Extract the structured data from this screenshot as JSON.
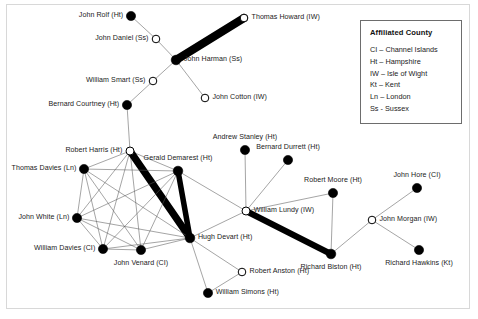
{
  "figure": {
    "background_color": "#ffffff",
    "frame_color": "#d8d8d8",
    "node_fill_color": "#000000",
    "node_hollow_color": "#ffffff",
    "edge_color": "#5a5a5a",
    "thick_edge_color": "#000000"
  },
  "legend": {
    "title": "Affiliated County",
    "entries": [
      "CI – Channel Islands",
      "Ht – Hampshire",
      "IW – Isle of Wight",
      "Kt – Kent",
      "Ln – London",
      "Ss - Sussex"
    ]
  },
  "chart_data": {
    "type": "network",
    "title": "",
    "xlabel": "",
    "ylabel": "",
    "legend_position": "top-right",
    "grid": false,
    "node_shape_meaning": {
      "filled": "solid black circle",
      "hollow": "open white circle with black outline"
    },
    "nodes": [
      {
        "id": "john_rolf",
        "label": "John Rolf (Ht)",
        "county": "Ht",
        "x": 131,
        "y": 16,
        "fill": "filled",
        "label_side": "right",
        "size": 5.2
      },
      {
        "id": "thomas_howard",
        "label": "Thomas Howard (IW)",
        "county": "IW",
        "x": 244,
        "y": 18,
        "fill": "hollow",
        "label_side": "left",
        "size": 5.0
      },
      {
        "id": "john_daniel",
        "label": "John Daniel (Ss)",
        "county": "Ss",
        "x": 156,
        "y": 39,
        "fill": "hollow",
        "label_side": "right",
        "size": 5.0
      },
      {
        "id": "john_harman",
        "label": "John Harman (Ss)",
        "county": "Ss",
        "x": 176,
        "y": 60,
        "fill": "filled",
        "label_side": "left",
        "size": 5.4
      },
      {
        "id": "william_smart",
        "label": "William Smart (Ss)",
        "county": "Ss",
        "x": 153,
        "y": 81,
        "fill": "hollow",
        "label_side": "right",
        "size": 5.0
      },
      {
        "id": "john_cotton",
        "label": "John Cotton (IW)",
        "county": "IW",
        "x": 205,
        "y": 98,
        "fill": "hollow",
        "label_side": "left",
        "size": 5.0
      },
      {
        "id": "bernard_courtney",
        "label": "Bernard Courtney (Ht)",
        "county": "Ht",
        "x": 127,
        "y": 105,
        "fill": "filled",
        "label_side": "right",
        "size": 5.2
      },
      {
        "id": "robert_harris",
        "label": "Robert Harris (Ht)",
        "county": "Ht",
        "x": 130,
        "y": 151,
        "fill": "hollow",
        "label_side": "right",
        "size": 5.2
      },
      {
        "id": "andrew_stanley",
        "label": "Andrew Stanley (Ht)",
        "county": "Ht",
        "x": 245,
        "y": 150,
        "fill": "filled",
        "label_side": "above",
        "size": 5.2
      },
      {
        "id": "bernard_durrett",
        "label": "Bernard Durrett (Ht)",
        "county": "Ht",
        "x": 288,
        "y": 160,
        "fill": "filled",
        "label_side": "above",
        "size": 5.2
      },
      {
        "id": "gerald_demarest",
        "label": "Gerald Demarest (Ht)",
        "county": "Ht",
        "x": 178,
        "y": 171,
        "fill": "filled",
        "label_side": "above",
        "size": 5.4
      },
      {
        "id": "thomas_davies",
        "label": "Thomas Davies (Ln)",
        "county": "Ln",
        "x": 84,
        "y": 169,
        "fill": "filled",
        "label_side": "right",
        "size": 5.2
      },
      {
        "id": "robert_moore",
        "label": "Robert Moore (Ht)",
        "county": "Ht",
        "x": 333,
        "y": 193,
        "fill": "filled",
        "label_side": "above",
        "size": 5.2
      },
      {
        "id": "john_hore",
        "label": "John Hore (CI)",
        "county": "CI",
        "x": 417,
        "y": 188,
        "fill": "filled",
        "label_side": "above",
        "size": 5.2
      },
      {
        "id": "william_lundy",
        "label": "William Lundy (IW)",
        "county": "IW",
        "x": 246,
        "y": 211,
        "fill": "hollow",
        "label_side": "left",
        "size": 5.2
      },
      {
        "id": "john_white",
        "label": "John White (Ln)",
        "county": "Ln",
        "x": 77,
        "y": 218,
        "fill": "filled",
        "label_side": "right",
        "size": 5.2
      },
      {
        "id": "john_morgan",
        "label": "John Morgan (IW)",
        "county": "IW",
        "x": 372,
        "y": 220,
        "fill": "hollow",
        "label_side": "left",
        "size": 5.0
      },
      {
        "id": "hugh_devart",
        "label": "Hugh Devart (Ht)",
        "county": "Ht",
        "x": 190,
        "y": 238,
        "fill": "filled",
        "label_side": "left",
        "size": 5.4
      },
      {
        "id": "william_davies",
        "label": "William Davies (CI)",
        "county": "CI",
        "x": 103,
        "y": 249,
        "fill": "filled",
        "label_side": "right",
        "size": 5.2
      },
      {
        "id": "john_venard",
        "label": "John Venard (CI)",
        "county": "CI",
        "x": 141,
        "y": 250,
        "fill": "filled",
        "label_side": "below",
        "size": 5.2
      },
      {
        "id": "richard_hawkins",
        "label": "Richard Hawkins (Kt)",
        "county": "Kt",
        "x": 419,
        "y": 250,
        "fill": "filled",
        "label_side": "below",
        "size": 5.2
      },
      {
        "id": "richard_biston",
        "label": "Richard Biston (Ht)",
        "county": "Ht",
        "x": 331,
        "y": 254,
        "fill": "filled",
        "label_side": "below",
        "size": 5.4
      },
      {
        "id": "robert_anston",
        "label": "Robert Anston (Ht)",
        "county": "Ht",
        "x": 242,
        "y": 272,
        "fill": "hollow",
        "label_side": "left",
        "size": 5.0
      },
      {
        "id": "william_simons",
        "label": "William Simons (Ht)",
        "county": "Ht",
        "x": 208,
        "y": 293,
        "fill": "filled",
        "label_side": "left",
        "size": 5.2
      }
    ],
    "edges": [
      {
        "source": "john_rolf",
        "target": "john_daniel",
        "weight": 1
      },
      {
        "source": "john_daniel",
        "target": "john_harman",
        "weight": 1
      },
      {
        "source": "john_harman",
        "target": "thomas_howard",
        "weight": 9
      },
      {
        "source": "john_harman",
        "target": "john_cotton",
        "weight": 1
      },
      {
        "source": "john_harman",
        "target": "william_smart",
        "weight": 1
      },
      {
        "source": "william_smart",
        "target": "bernard_courtney",
        "weight": 1
      },
      {
        "source": "bernard_courtney",
        "target": "robert_harris",
        "weight": 1
      },
      {
        "source": "robert_harris",
        "target": "thomas_davies",
        "weight": 1
      },
      {
        "source": "robert_harris",
        "target": "john_white",
        "weight": 1
      },
      {
        "source": "robert_harris",
        "target": "william_davies",
        "weight": 1
      },
      {
        "source": "robert_harris",
        "target": "john_venard",
        "weight": 1
      },
      {
        "source": "robert_harris",
        "target": "gerald_demarest",
        "weight": 1
      },
      {
        "source": "robert_harris",
        "target": "hugh_devart",
        "weight": 8
      },
      {
        "source": "thomas_davies",
        "target": "john_white",
        "weight": 1
      },
      {
        "source": "thomas_davies",
        "target": "william_davies",
        "weight": 1
      },
      {
        "source": "thomas_davies",
        "target": "john_venard",
        "weight": 1
      },
      {
        "source": "thomas_davies",
        "target": "gerald_demarest",
        "weight": 1
      },
      {
        "source": "thomas_davies",
        "target": "hugh_devart",
        "weight": 1
      },
      {
        "source": "john_white",
        "target": "william_davies",
        "weight": 1
      },
      {
        "source": "john_white",
        "target": "john_venard",
        "weight": 1
      },
      {
        "source": "john_white",
        "target": "gerald_demarest",
        "weight": 1
      },
      {
        "source": "john_white",
        "target": "hugh_devart",
        "weight": 1
      },
      {
        "source": "william_davies",
        "target": "john_venard",
        "weight": 1
      },
      {
        "source": "william_davies",
        "target": "gerald_demarest",
        "weight": 1
      },
      {
        "source": "william_davies",
        "target": "hugh_devart",
        "weight": 1
      },
      {
        "source": "john_venard",
        "target": "gerald_demarest",
        "weight": 1
      },
      {
        "source": "john_venard",
        "target": "hugh_devart",
        "weight": 1
      },
      {
        "source": "gerald_demarest",
        "target": "hugh_devart",
        "weight": 6
      },
      {
        "source": "gerald_demarest",
        "target": "william_lundy",
        "weight": 1
      },
      {
        "source": "hugh_devart",
        "target": "william_lundy",
        "weight": 1
      },
      {
        "source": "hugh_devart",
        "target": "robert_anston",
        "weight": 1
      },
      {
        "source": "hugh_devart",
        "target": "william_simons",
        "weight": 1
      },
      {
        "source": "robert_anston",
        "target": "william_simons",
        "weight": 1
      },
      {
        "source": "william_lundy",
        "target": "andrew_stanley",
        "weight": 1
      },
      {
        "source": "william_lundy",
        "target": "bernard_durrett",
        "weight": 1
      },
      {
        "source": "william_lundy",
        "target": "robert_moore",
        "weight": 1
      },
      {
        "source": "william_lundy",
        "target": "richard_biston",
        "weight": 7
      },
      {
        "source": "robert_moore",
        "target": "richard_biston",
        "weight": 1
      },
      {
        "source": "richard_biston",
        "target": "john_morgan",
        "weight": 1
      },
      {
        "source": "john_morgan",
        "target": "john_hore",
        "weight": 1
      },
      {
        "source": "john_morgan",
        "target": "richard_hawkins",
        "weight": 1
      }
    ]
  }
}
